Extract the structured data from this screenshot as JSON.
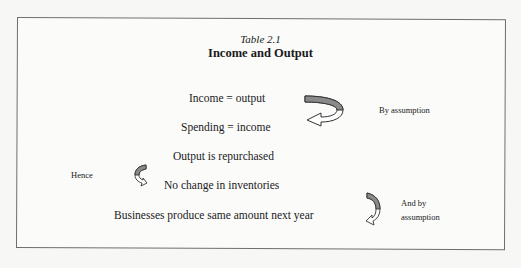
{
  "table": {
    "caption": "Table 2.1",
    "title": "Income and Output"
  },
  "lines": [
    "Income = output",
    "Spending = income",
    "Output is repurchased",
    "No change in inventories",
    "Businesses produce same amount next year"
  ],
  "annotations": {
    "by_assumption": "By assumption",
    "hence": "Hence",
    "and_by_line1": "And by",
    "and_by_line2": "assumption"
  },
  "icons": {
    "arrow_1": "curved-arrow-down-left",
    "arrow_2": "curved-arrow-down-small",
    "arrow_3": "curved-arrow-down-right"
  },
  "colors": {
    "arrow_fill": "#8a8a8a",
    "border": "#6e6e6e",
    "text": "#1a1a1a"
  }
}
